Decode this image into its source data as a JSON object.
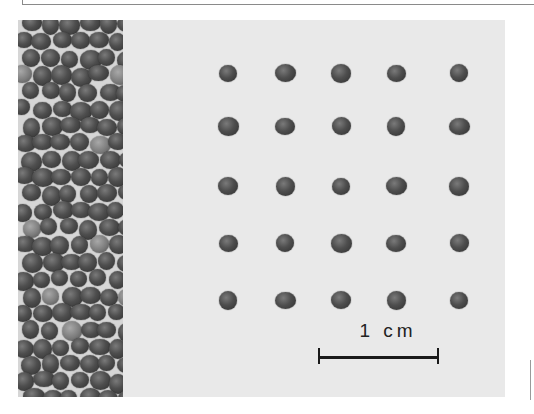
{
  "figure": {
    "scale_bar": {
      "label": "1 cm"
    },
    "grid": {
      "rows": 5,
      "cols": 5,
      "col_x": [
        210,
        267,
        323,
        378,
        441
      ],
      "row_y": [
        53,
        106,
        166,
        223,
        280
      ]
    },
    "colors": {
      "background": "#e9e9e9",
      "seed": "#3a3a3a",
      "scale_bar": "#1a1a1a"
    }
  }
}
